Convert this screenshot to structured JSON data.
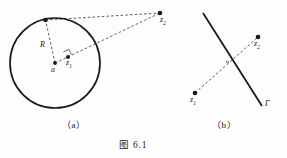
{
  "figure": {
    "caption": "图 6.1",
    "background_color": "#fdfdfd",
    "ink_color": "#1a1a1a",
    "panels": [
      {
        "id": "a",
        "label": "（a）",
        "description": "circle of radius R centered at a, with tangent point on circle, interior point z1 and exterior point z2 joined by dashed lines",
        "labels": [
          {
            "name": "radius-label",
            "text": "R"
          },
          {
            "name": "center-label",
            "text": "a"
          },
          {
            "name": "point-z1-label",
            "text": "z",
            "sub": "1"
          },
          {
            "name": "point-z2-label",
            "text": "z",
            "sub": "2"
          }
        ],
        "circle": {
          "cx": 55,
          "cy": 63,
          "r": 45,
          "stroke_width": 1.6
        },
        "points": [
          {
            "name": "center-point-a",
            "x": 55,
            "y": 63,
            "r": 1.9
          },
          {
            "name": "point-z1",
            "x": 68,
            "y": 57,
            "r": 2.0
          },
          {
            "name": "point-z2",
            "x": 160,
            "y": 13,
            "r": 2.3
          },
          {
            "name": "tangent-point",
            "x": 45.5,
            "y": 20,
            "r": 2.3
          }
        ],
        "dashed_segments": [
          {
            "name": "segment-a-to-tangent",
            "x1": 55,
            "y1": 63,
            "x2": 45.5,
            "y2": 20
          },
          {
            "name": "segment-tangent-to-z2",
            "x1": 45.5,
            "y1": 20,
            "x2": 160,
            "y2": 13
          },
          {
            "name": "segment-a-to-z2",
            "x1": 55,
            "y1": 63,
            "x2": 160,
            "y2": 13
          }
        ],
        "right_angle_marker": {
          "name": "right-angle-marker",
          "x": 68,
          "y": 57
        }
      },
      {
        "id": "b",
        "label": "（b）",
        "description": "straight line Gamma crossed by a dashed segment joining z1 and z2",
        "labels": [
          {
            "name": "line-gamma-label",
            "text": "Γ"
          },
          {
            "name": "point-z1-label",
            "text": "z",
            "sub": "1"
          },
          {
            "name": "point-z2-label",
            "text": "z",
            "sub": "2"
          }
        ],
        "line_gamma": {
          "x1": 203,
          "y1": 13,
          "x2": 262,
          "y2": 106,
          "stroke_width": 1.8
        },
        "points": [
          {
            "name": "point-z1",
            "x": 195,
            "y": 93,
            "r": 2.3
          },
          {
            "name": "point-z2",
            "x": 258,
            "y": 37,
            "r": 2.3
          }
        ],
        "dashed_segments": [
          {
            "name": "segment-z1-to-z2",
            "x1": 195,
            "y1": 93,
            "x2": 258,
            "y2": 37
          }
        ],
        "intersection_marker": {
          "name": "intersection-point",
          "x": 227,
          "y": 60
        }
      }
    ]
  }
}
